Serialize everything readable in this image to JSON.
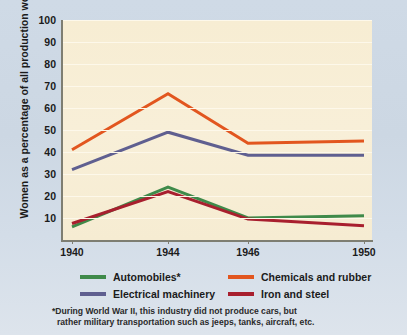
{
  "chart_data": {
    "type": "line",
    "title": "",
    "xlabel": "",
    "ylabel": "Women as a percentage of all production workers",
    "x": [
      "1940",
      "1944",
      "1946",
      "1950"
    ],
    "xlim": [
      1940,
      1950
    ],
    "ylim": [
      0,
      100
    ],
    "yticks": [
      100,
      90,
      80,
      70,
      60,
      50,
      40,
      30,
      20,
      10
    ],
    "grid": true,
    "legend_position": "bottom",
    "series": [
      {
        "name": "Automobiles*",
        "color": "#3f8a4a",
        "values": [
          6,
          24,
          10,
          11
        ]
      },
      {
        "name": "Chemicals and rubber",
        "color": "#e2561f",
        "values": [
          41,
          66.5,
          44,
          45
        ]
      },
      {
        "name": "Electrical machinery",
        "color": "#5f5f90",
        "values": [
          32,
          49,
          38.5,
          38.5
        ]
      },
      {
        "name": "Iron and steel",
        "color": "#a81f2e",
        "values": [
          7.5,
          22,
          9.5,
          6.5
        ]
      }
    ],
    "annotations": [
      "*During World War II, this industry did not produce cars, but",
      "rather military transportation such as jeeps, tanks, aircraft, etc."
    ]
  },
  "legend": {
    "rows": [
      [
        {
          "label": "Automobiles*",
          "color": "#3f8a4a"
        },
        {
          "label": "Chemicals and rubber",
          "color": "#e2561f"
        }
      ],
      [
        {
          "label": "Electrical machinery",
          "color": "#5f5f90"
        },
        {
          "label": "Iron and steel",
          "color": "#a81f2e"
        }
      ]
    ]
  },
  "footnote": {
    "line1": "*During World War II, this industry did not produce cars, but",
    "line2": "rather military transportation such as jeeps, tanks, aircraft, etc."
  },
  "colors": {
    "panel_bg": "#f7edd3",
    "page_bg": "#ccd8e4",
    "axis": "#7e7e72",
    "gridline": "#fdf8ea"
  }
}
